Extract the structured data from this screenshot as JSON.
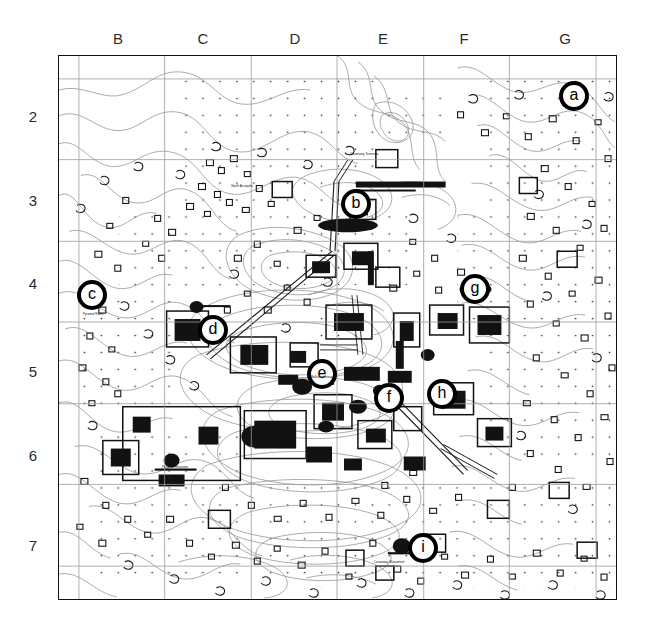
{
  "figure": {
    "kind": "archaeological-site-plan",
    "title": "",
    "background_color": "#ffffff",
    "ink_color": "#000000",
    "contour_color": "#8c8c8c"
  },
  "grid": {
    "columns": [
      "B",
      "C",
      "D",
      "E",
      "F",
      "G"
    ],
    "rows": [
      "2",
      "3",
      "4",
      "5",
      "6",
      "7"
    ],
    "column_x": [
      118,
      203,
      295,
      383,
      464,
      565
    ],
    "row_y": [
      116,
      200,
      283,
      371,
      455,
      545
    ],
    "frame": {
      "left": 58,
      "top": 55,
      "width": 559,
      "height": 545
    },
    "vertical_lines": [
      78,
      164,
      251,
      337,
      424,
      510,
      597
    ],
    "horizontal_lines": [
      78,
      159,
      241,
      322,
      404,
      485,
      567
    ],
    "line_color": "#9a9a9a",
    "border_color": "#111111"
  },
  "markers": [
    {
      "id": "a",
      "label": "a",
      "x": 573,
      "y": 95,
      "caption": ""
    },
    {
      "id": "b",
      "label": "b",
      "x": 355,
      "y": 203,
      "caption": ""
    },
    {
      "id": "c",
      "label": "c",
      "x": 91,
      "y": 294,
      "caption": "Pyramid Ruins"
    },
    {
      "id": "d",
      "label": "d",
      "x": 212,
      "y": 329,
      "caption": ""
    },
    {
      "id": "e",
      "label": "e",
      "x": 321,
      "y": 373,
      "caption": ""
    },
    {
      "id": "f",
      "label": "f",
      "x": 388,
      "y": 397,
      "caption": ""
    },
    {
      "id": "g",
      "label": "g",
      "x": 474,
      "y": 288,
      "caption": ""
    },
    {
      "id": "h",
      "label": "h",
      "x": 441,
      "y": 393,
      "caption": ""
    },
    {
      "id": "i",
      "label": "i",
      "x": 422,
      "y": 547,
      "caption": "Causeway Monument"
    }
  ],
  "site_captions": [
    {
      "text": "Causeway Terminus",
      "x": 356,
      "y": 150
    },
    {
      "text": "North Acropolis",
      "x": 240,
      "y": 182
    },
    {
      "text": "Ballcourt Group",
      "x": 318,
      "y": 372
    },
    {
      "text": "Pyramid Reservoir",
      "x": 166,
      "y": 462
    }
  ],
  "legend": {
    "visible": false,
    "entries": []
  }
}
